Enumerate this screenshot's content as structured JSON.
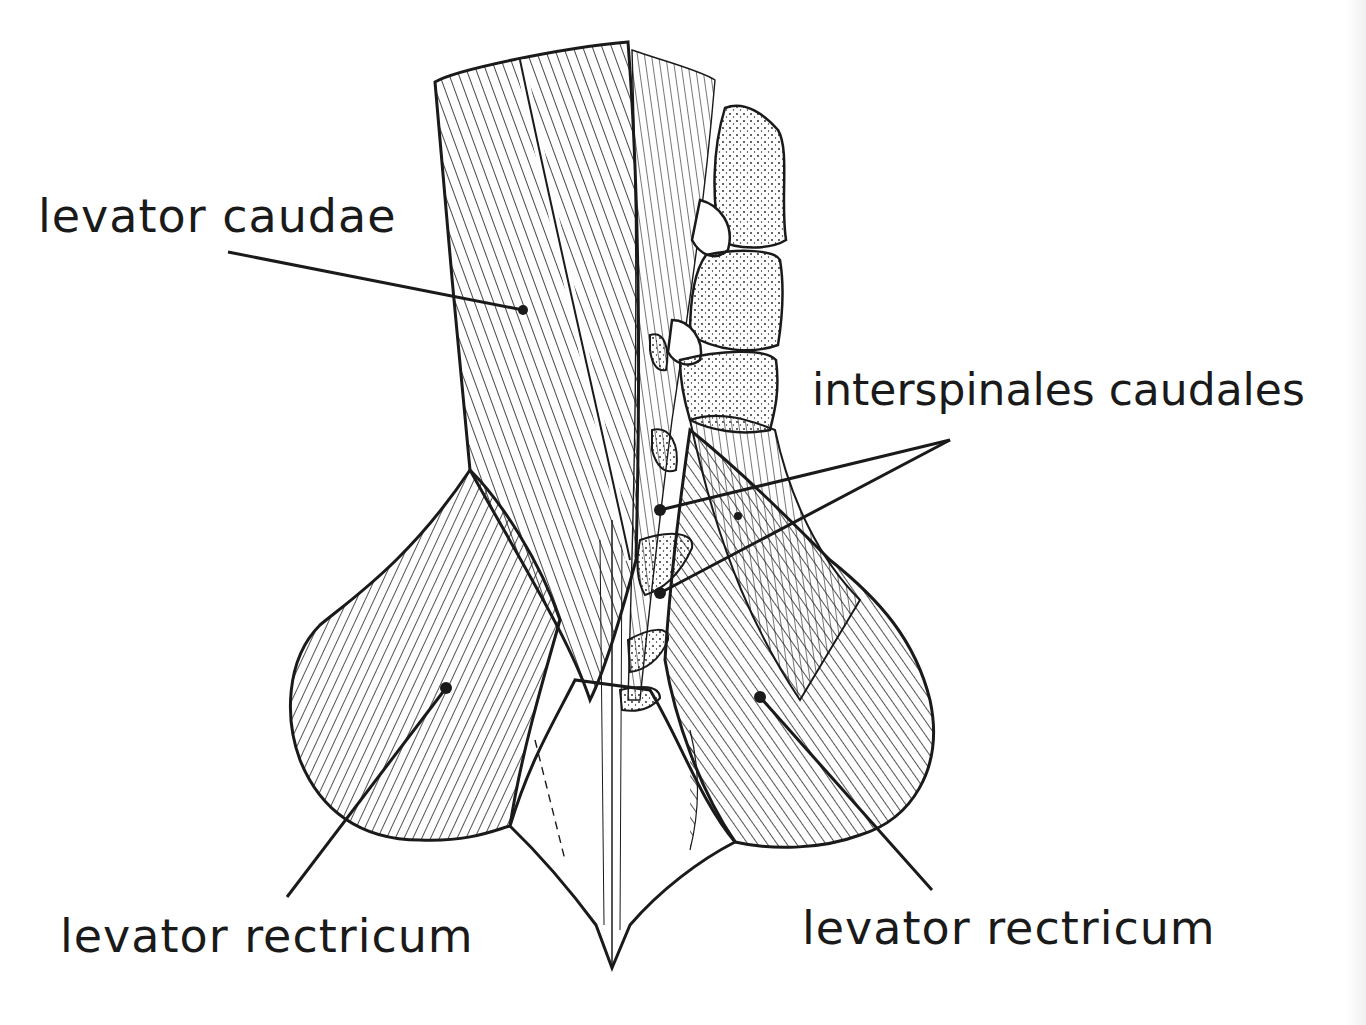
{
  "figure": {
    "type": "anatomical line drawing",
    "colors": {
      "ink": "#1a1a1a",
      "background": "#ffffff"
    }
  },
  "labels": {
    "levator_caudae": "levator caudae",
    "interspinales_caudales": "interspinales caudales",
    "levator_rectricum_left": "levator rectricum",
    "levator_rectricum_right": "levator rectricum"
  },
  "leaders": [
    {
      "label": "levator caudae",
      "from": [
        228,
        252
      ],
      "to": [
        523,
        310
      ]
    },
    {
      "label": "interspinales caudales",
      "from": [
        950,
        440
      ],
      "to": [
        660,
        510
      ]
    },
    {
      "label": "interspinales caudales",
      "from": [
        950,
        440
      ],
      "to": [
        660,
        593
      ]
    },
    {
      "label": "levator rectricum (left)",
      "from": [
        287,
        897
      ],
      "to": [
        446,
        688
      ]
    },
    {
      "label": "levator rectricum (right)",
      "from": [
        932,
        890
      ],
      "to": [
        760,
        697
      ]
    }
  ]
}
